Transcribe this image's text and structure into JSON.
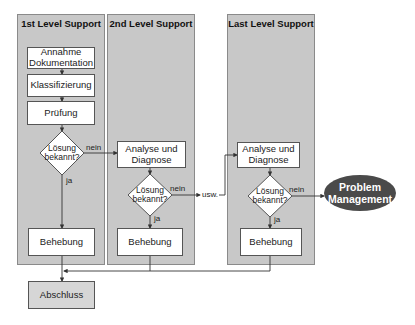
{
  "diagram": {
    "panels": [
      {
        "title": "1st Level Support"
      },
      {
        "title": "2nd Level Support"
      },
      {
        "title": "Last Level Support"
      }
    ],
    "level1": {
      "step1": "Annahme Dokumentation",
      "step1_line1": "Annahme",
      "step1_line2": "Dokumentation",
      "step2": "Klassifizierung",
      "step3": "Prüfung",
      "decision_line1": "Lösung",
      "decision_line2": "bekannt?",
      "no_label": "nein",
      "yes_label": "ja",
      "resolve": "Behebung"
    },
    "level2": {
      "analysis_line1": "Analyse und",
      "analysis_line2": "Diagnose",
      "decision_line1": "Lösung",
      "decision_line2": "bekannt?",
      "no_label": "nein",
      "yes_label": "ja",
      "resolve": "Behebung",
      "continue_label": "usw."
    },
    "level3": {
      "analysis_line1": "Analyse und",
      "analysis_line2": "Diagnose",
      "decision_line1": "Lösung",
      "decision_line2": "bekannt?",
      "no_label": "nein",
      "yes_label": "ja",
      "resolve": "Behebung"
    },
    "problem_management": {
      "line1": "Problem",
      "line2": "Management"
    },
    "closure": "Abschluss",
    "colors": {
      "panel_fill": "#c8c8c8",
      "box_fill": "#ffffff",
      "closure_fill": "#d6d6d6",
      "ellipse_fill": "#4a4a4a",
      "line": "#333333"
    }
  }
}
